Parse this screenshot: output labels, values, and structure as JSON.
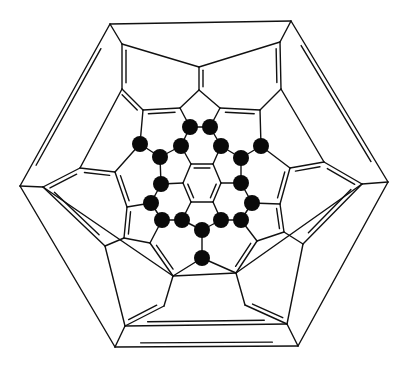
{
  "diagram": {
    "type": "schlegel-diagram",
    "colors": {
      "line": "#111111",
      "atom": "#0a0a0a",
      "background": "#ffffff"
    },
    "nodes": {
      "o1": [
        110,
        24
      ],
      "o2": [
        291,
        21
      ],
      "o3": [
        388,
        182
      ],
      "o4": [
        298,
        346
      ],
      "o5": [
        115,
        347
      ],
      "o6": [
        20,
        186
      ],
      "r1": [
        122,
        44
      ],
      "r2": [
        280,
        42
      ],
      "r3": [
        362,
        184
      ],
      "r4": [
        287,
        324
      ],
      "r5": [
        125,
        326
      ],
      "r6": [
        43,
        187
      ],
      "t1": [
        199,
        67
      ],
      "t2": [
        199,
        90
      ],
      "a1": [
        122,
        89
      ],
      "a2": [
        281,
        89
      ],
      "p1": [
        143,
        110
      ],
      "p2": [
        180,
        108
      ],
      "p3": [
        220,
        108
      ],
      "p4": [
        260,
        110
      ],
      "l1": [
        80,
        168
      ],
      "l2": [
        115,
        172
      ],
      "l3": [
        127,
        207
      ],
      "l4": [
        124,
        238
      ],
      "l5": [
        105,
        246
      ],
      "g1": [
        324,
        162
      ],
      "g2": [
        290,
        168
      ],
      "g3": [
        280,
        204
      ],
      "g4": [
        284,
        232
      ],
      "g5": [
        303,
        244
      ],
      "b1": [
        150,
        243
      ],
      "b2": [
        173,
        276
      ],
      "b3": [
        164,
        306
      ],
      "b4": [
        236,
        273
      ],
      "b5": [
        245,
        305
      ],
      "b6": [
        257,
        241
      ],
      "h1": [
        191,
        164
      ],
      "h2": [
        213,
        164
      ],
      "h3": [
        221,
        183
      ],
      "h4": [
        213,
        202
      ],
      "h5": [
        191,
        202
      ],
      "h6": [
        183,
        183
      ],
      "k1": [
        190,
        127
      ],
      "k2": [
        210,
        127
      ],
      "k3": [
        181,
        146
      ],
      "k4": [
        221,
        146
      ],
      "k5": [
        160,
        157
      ],
      "k6": [
        241,
        158
      ],
      "k7": [
        140,
        144
      ],
      "k8": [
        261,
        146
      ],
      "k9": [
        161,
        184
      ],
      "k10": [
        241,
        183
      ],
      "k11": [
        151,
        203
      ],
      "k12": [
        252,
        203
      ],
      "k13": [
        162,
        220
      ],
      "k14": [
        182,
        220
      ],
      "k15": [
        221,
        220
      ],
      "k16": [
        241,
        220
      ],
      "k17": [
        202,
        230
      ],
      "k18": [
        202,
        258
      ]
    },
    "single_bonds": [
      [
        "o1",
        "o2"
      ],
      [
        "o1",
        "r1"
      ],
      [
        "o2",
        "r2"
      ],
      [
        "o3",
        "r3"
      ],
      [
        "o4",
        "r4"
      ],
      [
        "o5",
        "r5"
      ],
      [
        "o6",
        "r6"
      ],
      [
        "o3",
        "o4"
      ],
      [
        "o5",
        "o6"
      ],
      [
        "r1",
        "t1"
      ],
      [
        "r2",
        "t1"
      ],
      [
        "r1",
        "a1"
      ],
      [
        "r2",
        "a2"
      ],
      [
        "t2",
        "p2"
      ],
      [
        "t2",
        "p3"
      ],
      [
        "a1",
        "p1"
      ],
      [
        "a2",
        "p4"
      ],
      [
        "r6",
        "l1"
      ],
      [
        "r6",
        "b2"
      ],
      [
        "r3",
        "g1"
      ],
      [
        "r3",
        "b4"
      ],
      [
        "l1",
        "a1"
      ],
      [
        "g1",
        "a2"
      ],
      [
        "l2",
        "l1"
      ],
      [
        "g2",
        "g1"
      ],
      [
        "l4",
        "l5"
      ],
      [
        "g4",
        "g5"
      ],
      [
        "l5",
        "r5"
      ],
      [
        "g5",
        "r4"
      ],
      [
        "b1",
        "l4"
      ],
      [
        "b6",
        "g4"
      ],
      [
        "b2",
        "b3"
      ],
      [
        "b4",
        "b5"
      ],
      [
        "b2",
        "b4"
      ],
      [
        "b2",
        "b1"
      ],
      [
        "b4",
        "b6"
      ],
      [
        "p2",
        "k1"
      ],
      [
        "p3",
        "k2"
      ],
      [
        "k1",
        "k2"
      ],
      [
        "k1",
        "k3"
      ],
      [
        "k2",
        "k4"
      ],
      [
        "k3",
        "h1"
      ],
      [
        "k4",
        "h2"
      ],
      [
        "k3",
        "k5"
      ],
      [
        "k4",
        "k6"
      ],
      [
        "p1",
        "k7"
      ],
      [
        "p4",
        "k8"
      ],
      [
        "k7",
        "k5"
      ],
      [
        "k8",
        "k6"
      ],
      [
        "k7",
        "l2"
      ],
      [
        "k8",
        "g2"
      ],
      [
        "k5",
        "k9"
      ],
      [
        "k6",
        "k10"
      ],
      [
        "k9",
        "h6"
      ],
      [
        "k10",
        "h3"
      ],
      [
        "k9",
        "k11"
      ],
      [
        "k10",
        "k12"
      ],
      [
        "k11",
        "l3"
      ],
      [
        "k12",
        "g3"
      ],
      [
        "k11",
        "k13"
      ],
      [
        "k12",
        "k16"
      ],
      [
        "k13",
        "k14"
      ],
      [
        "k15",
        "k16"
      ],
      [
        "k14",
        "h5"
      ],
      [
        "k15",
        "h4"
      ],
      [
        "k14",
        "k17"
      ],
      [
        "k15",
        "k17"
      ],
      [
        "k17",
        "k18"
      ],
      [
        "k13",
        "b1"
      ],
      [
        "k16",
        "b6"
      ],
      [
        "k18",
        "b2"
      ],
      [
        "k18",
        "b4"
      ],
      [
        "h1",
        "h6"
      ],
      [
        "h2",
        "h3"
      ],
      [
        "h4",
        "h5"
      ]
    ],
    "double_bonds": [
      [
        "o2",
        "o3"
      ],
      [
        "o4",
        "o5"
      ],
      [
        "o6",
        "o1"
      ],
      [
        "r1",
        "a1"
      ],
      [
        "r2",
        "a2"
      ],
      [
        "t1",
        "t2"
      ],
      [
        "a1",
        "p1"
      ],
      [
        "p1",
        "p2"
      ],
      [
        "p3",
        "p4"
      ],
      [
        "r6",
        "l1"
      ],
      [
        "l1",
        "l2"
      ],
      [
        "l2",
        "l3"
      ],
      [
        "l3",
        "l4"
      ],
      [
        "l5",
        "r6"
      ],
      [
        "r3",
        "g1"
      ],
      [
        "g1",
        "g2"
      ],
      [
        "g2",
        "g3"
      ],
      [
        "g3",
        "g4"
      ],
      [
        "g5",
        "r3"
      ],
      [
        "b1",
        "b2"
      ],
      [
        "b3",
        "r5"
      ],
      [
        "b5",
        "r4"
      ],
      [
        "b6",
        "b4"
      ],
      [
        "r5",
        "r4"
      ],
      [
        "h1",
        "h2"
      ],
      [
        "h3",
        "h4"
      ],
      [
        "h5",
        "h6"
      ]
    ],
    "highlighted_atoms": [
      "k1",
      "k2",
      "k3",
      "k4",
      "k5",
      "k6",
      "k7",
      "k8",
      "k9",
      "k10",
      "k11",
      "k12",
      "k13",
      "k14",
      "k15",
      "k16",
      "k17",
      "k18"
    ]
  }
}
